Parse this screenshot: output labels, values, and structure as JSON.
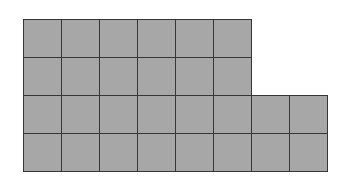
{
  "diagram": {
    "type": "grid-of-squares",
    "origin": {
      "x": 23,
      "y": 19
    },
    "cell_size": 38,
    "rows": [
      {
        "columns": 6
      },
      {
        "columns": 6
      },
      {
        "columns": 8
      },
      {
        "columns": 8
      }
    ],
    "total_squares": 28,
    "colors": {
      "fill": "#a7a7a7",
      "line": "#363636",
      "background": "#ffffff"
    }
  }
}
